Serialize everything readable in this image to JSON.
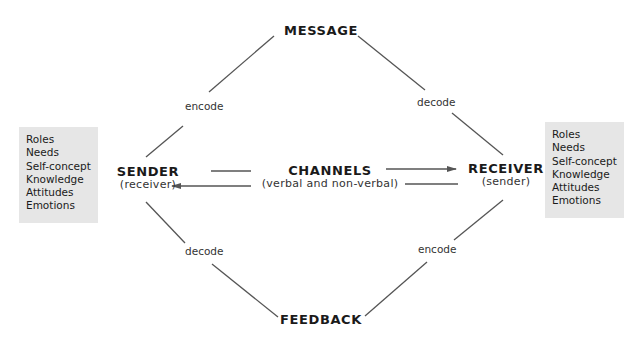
{
  "diagram": {
    "nodes": {
      "message": {
        "title": "MESSAGE"
      },
      "sender": {
        "title": "SENDER",
        "subtitle": "(receiver)"
      },
      "channels": {
        "title": "CHANNELS",
        "subtitle": "(verbal and non-verbal)"
      },
      "receiver": {
        "title": "RECEIVER",
        "subtitle": "(sender)"
      },
      "feedback": {
        "title": "FEEDBACK"
      }
    },
    "edge_labels": {
      "sender_to_message": "encode",
      "message_to_receiver": "decode",
      "feedback_to_sender": "decode",
      "receiver_to_feedback": "encode"
    },
    "sender_attributes": [
      "Roles",
      "Needs",
      "Self-concept",
      "Knowledge",
      "Attitudes",
      "Emotions"
    ],
    "receiver_attributes": [
      "Roles",
      "Needs",
      "Self-concept",
      "Knowledge",
      "Attitudes",
      "Emotions"
    ],
    "colors": {
      "line": "#555555",
      "box_fill": "#e6e6e6",
      "text": "#1a1a1a"
    }
  }
}
